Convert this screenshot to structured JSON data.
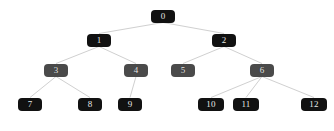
{
  "figure": {
    "title": "",
    "background_color": "#ffffff",
    "edge_color": "#d0d0d0",
    "node_text_color": "#e8e8e8",
    "colors": {
      "black_node": "#111111",
      "gray_node": "#4a4a4a"
    }
  },
  "chart_data": {
    "type": "diagram",
    "title": "",
    "xlabel": "",
    "ylabel": "",
    "layout": "top-down tree, 4 levels, straight-line edges",
    "levels": [
      {
        "depth": 0,
        "labels": [
          "0"
        ]
      },
      {
        "depth": 1,
        "labels": [
          "1",
          "2"
        ]
      },
      {
        "depth": 2,
        "labels": [
          "3",
          "4",
          "5",
          "6"
        ]
      },
      {
        "depth": 3,
        "labels": [
          "7",
          "8",
          "9",
          "10",
          "11",
          "12"
        ]
      }
    ],
    "nodes": [
      {
        "id": "0",
        "label": "0",
        "depth": 0,
        "x": 163,
        "y": 16,
        "w": 24,
        "h": 13,
        "color": "#111111",
        "shade": "black"
      },
      {
        "id": "1",
        "label": "1",
        "depth": 1,
        "x": 99,
        "y": 40,
        "w": 24,
        "h": 13,
        "color": "#111111",
        "shade": "black"
      },
      {
        "id": "2",
        "label": "2",
        "depth": 1,
        "x": 224,
        "y": 40,
        "w": 24,
        "h": 13,
        "color": "#111111",
        "shade": "black"
      },
      {
        "id": "3",
        "label": "3",
        "depth": 2,
        "x": 56,
        "y": 70,
        "w": 24,
        "h": 13,
        "color": "#4a4a4a",
        "shade": "gray"
      },
      {
        "id": "4",
        "label": "4",
        "depth": 2,
        "x": 136,
        "y": 70,
        "w": 24,
        "h": 13,
        "color": "#4a4a4a",
        "shade": "gray"
      },
      {
        "id": "5",
        "label": "5",
        "depth": 2,
        "x": 183,
        "y": 70,
        "w": 24,
        "h": 13,
        "color": "#4a4a4a",
        "shade": "gray"
      },
      {
        "id": "6",
        "label": "6",
        "depth": 2,
        "x": 262,
        "y": 70,
        "w": 24,
        "h": 13,
        "color": "#4a4a4a",
        "shade": "gray"
      },
      {
        "id": "7",
        "label": "7",
        "depth": 3,
        "x": 30,
        "y": 104,
        "w": 24,
        "h": 13,
        "color": "#111111",
        "shade": "black"
      },
      {
        "id": "8",
        "label": "8",
        "depth": 3,
        "x": 90,
        "y": 104,
        "w": 24,
        "h": 13,
        "color": "#111111",
        "shade": "black"
      },
      {
        "id": "9",
        "label": "9",
        "depth": 3,
        "x": 130,
        "y": 104,
        "w": 24,
        "h": 13,
        "color": "#111111",
        "shade": "black"
      },
      {
        "id": "10",
        "label": "10",
        "depth": 3,
        "x": 211,
        "y": 104,
        "w": 26,
        "h": 13,
        "color": "#111111",
        "shade": "black"
      },
      {
        "id": "11",
        "label": "11",
        "depth": 3,
        "x": 246,
        "y": 104,
        "w": 26,
        "h": 13,
        "color": "#111111",
        "shade": "black"
      },
      {
        "id": "12",
        "label": "12",
        "depth": 3,
        "x": 314,
        "y": 104,
        "w": 26,
        "h": 13,
        "color": "#111111",
        "shade": "black"
      }
    ],
    "edges": [
      {
        "from": "0",
        "to": "1"
      },
      {
        "from": "0",
        "to": "2"
      },
      {
        "from": "1",
        "to": "3"
      },
      {
        "from": "1",
        "to": "4"
      },
      {
        "from": "2",
        "to": "5"
      },
      {
        "from": "2",
        "to": "6"
      },
      {
        "from": "3",
        "to": "7"
      },
      {
        "from": "3",
        "to": "8"
      },
      {
        "from": "4",
        "to": "9"
      },
      {
        "from": "6",
        "to": "10"
      },
      {
        "from": "6",
        "to": "11"
      },
      {
        "from": "6",
        "to": "12"
      }
    ]
  }
}
